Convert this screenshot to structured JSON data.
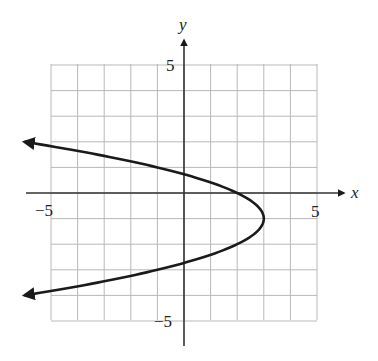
{
  "chart_data": {
    "type": "line",
    "title": "",
    "xlabel": "x",
    "ylabel": "y",
    "xlim": [
      -5,
      5
    ],
    "ylim": [
      -5,
      5
    ],
    "grid": true,
    "grid_step": 1,
    "tick_labels": {
      "x": [
        "-5",
        "5"
      ],
      "y": [
        "5",
        "-5"
      ]
    },
    "series": [
      {
        "name": "parabola",
        "equation": "x = -(y + 1)^2 + 3",
        "vertex": [
          3,
          -1
        ],
        "opens": "left",
        "x_intercept": [
          2,
          0
        ],
        "y_intercepts": [
          [
            0,
            0.73
          ],
          [
            0,
            -2.73
          ]
        ],
        "arrow_ends": [
          [
            -6,
            2
          ],
          [
            -6,
            -4
          ]
        ],
        "points": [
          [
            -6,
            2
          ],
          [
            -3.25,
            1.5
          ],
          [
            -1,
            1
          ],
          [
            0.75,
            0.5
          ],
          [
            2,
            0
          ],
          [
            2.75,
            -0.5
          ],
          [
            3,
            -1
          ],
          [
            2.75,
            -1.5
          ],
          [
            2,
            -2
          ],
          [
            0.75,
            -2.5
          ],
          [
            -1,
            -3
          ],
          [
            -3.25,
            -3.5
          ],
          [
            -6,
            -4
          ]
        ]
      }
    ]
  },
  "labels": {
    "x_axis": "x",
    "y_axis": "y",
    "x_min": "−5",
    "x_max": "5",
    "y_max": "5",
    "y_min": "−5"
  },
  "colors": {
    "grid": "#b8b8b8",
    "axes": "#333333",
    "curve": "#1a1a1a"
  }
}
